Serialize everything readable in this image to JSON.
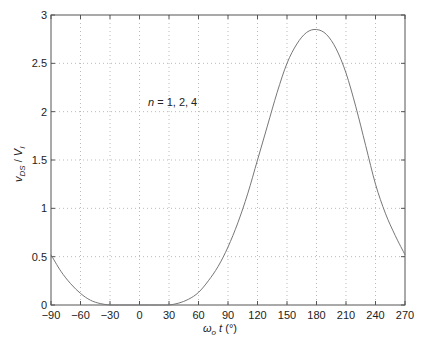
{
  "chart_data": {
    "type": "line",
    "title": "",
    "xlabel": "ω_o t (°)",
    "ylabel": "v_DS / V_I",
    "xlim": [
      -90,
      270
    ],
    "ylim": [
      0,
      3
    ],
    "grid": true,
    "xticks": [
      -90,
      -60,
      -30,
      0,
      30,
      60,
      90,
      120,
      150,
      180,
      210,
      240,
      270
    ],
    "yticks": [
      0,
      0.5,
      1,
      1.5,
      2,
      2.5,
      3
    ],
    "annotation": "n = 1, 2, 4",
    "series": [
      {
        "name": "v_DS/V_I",
        "x": [
          -90,
          -80,
          -70,
          -60,
          -50,
          -40,
          -30,
          -20,
          -10,
          0,
          10,
          20,
          30,
          40,
          50,
          60,
          70,
          80,
          90,
          100,
          110,
          120,
          130,
          140,
          150,
          160,
          170,
          180,
          190,
          200,
          210,
          220,
          230,
          240,
          250,
          260,
          270
        ],
        "y": [
          0.52,
          0.35,
          0.22,
          0.12,
          0.05,
          0.015,
          0.0,
          0.0,
          0.0,
          0.0,
          0.0,
          0.0,
          0.0,
          0.02,
          0.06,
          0.13,
          0.25,
          0.4,
          0.6,
          0.85,
          1.15,
          1.5,
          1.85,
          2.2,
          2.5,
          2.7,
          2.82,
          2.85,
          2.8,
          2.65,
          2.4,
          2.05,
          1.65,
          1.25,
          0.95,
          0.72,
          0.52
        ]
      }
    ]
  },
  "labels": {
    "xlabel_omega": "ω",
    "xlabel_sub": "o",
    "xlabel_rest": " t (°)",
    "ylabel_v": "v",
    "ylabel_sub1": "DS",
    "ylabel_mid": " / V",
    "ylabel_sub2": "I",
    "annotation": "n = 1, 2, 4"
  }
}
